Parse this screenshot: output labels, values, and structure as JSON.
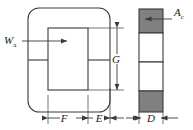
{
  "figure": {
    "type": "engineering-dimension-diagram",
    "background_color": "#ffffff",
    "line_color": "#3a3a3a",
    "shade_color": "#808080"
  },
  "labels": {
    "window_area": {
      "symbol": "W",
      "subscript": "a"
    },
    "core_area": {
      "symbol": "A",
      "subscript": "c"
    },
    "window_height": {
      "symbol": "G",
      "subscript": ""
    },
    "leg_width": {
      "symbol": "F",
      "subscript": ""
    },
    "window_width": {
      "symbol": "E",
      "subscript": ""
    },
    "depth": {
      "symbol": "D",
      "subscript": ""
    }
  },
  "views": {
    "front": {
      "name": "front-view",
      "outer": {
        "x": 28,
        "y": 8,
        "width": 82,
        "height": 104,
        "corner_radius": 11
      },
      "window": {
        "x": 48,
        "y": 28,
        "width": 40,
        "height": 62
      },
      "split_line_y": 60
    },
    "side": {
      "name": "side-view",
      "bar": {
        "x": 139,
        "y": 9,
        "width": 24,
        "height": 103
      },
      "segments": [
        {
          "shaded": true
        },
        {
          "shaded": false
        },
        {
          "shaded": false
        },
        {
          "shaded": true
        }
      ]
    }
  },
  "dimensions": {
    "G": {
      "orientation": "vertical",
      "x": 117,
      "y1": 28,
      "y2": 90
    },
    "F": {
      "orientation": "horizontal",
      "y": 118,
      "x1": 48,
      "x2": 88
    },
    "E": {
      "orientation": "horizontal",
      "y": 118,
      "x1": 88,
      "x2": 110
    },
    "D": {
      "orientation": "horizontal",
      "y": 118,
      "x1": 139,
      "x2": 163
    }
  }
}
